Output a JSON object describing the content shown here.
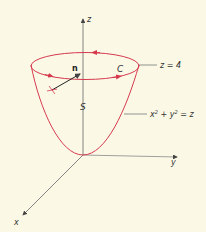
{
  "figure": {
    "axes": {
      "z_label": "z",
      "y_label": "y",
      "x_label": "x"
    },
    "normal_label": "n",
    "curve_label": "C",
    "surface_label": "S",
    "plane_label": "z = 4",
    "surface_equation": {
      "x": "x",
      "sup1": "2",
      "plus": " + ",
      "y": "y",
      "sup2": "2",
      "eq": " = z"
    },
    "colors": {
      "background": "#fbf9e6",
      "surface": "#d6394e",
      "axes": "#555555",
      "text": "#333333"
    }
  }
}
